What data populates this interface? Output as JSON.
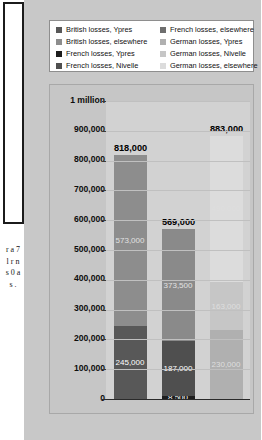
{
  "page_edge": {
    "side_text": "r a 7 l r n s 0 a s ."
  },
  "legend": {
    "left_column": [
      {
        "label": "British losses, Ypres",
        "color": "#585858"
      },
      {
        "label": "British losses, elsewhere",
        "color": "#8d8d8d"
      },
      {
        "label": "French losses, Ypres",
        "color": "#1d1d1d"
      },
      {
        "label": "French losses, Nivelle",
        "color": "#4f4f4f"
      }
    ],
    "right_column": [
      {
        "label": "French losses, elsewhere",
        "color": "#6e6e6e"
      },
      {
        "label": "German losses, Ypres",
        "color": "#b0b0b0"
      },
      {
        "label": "German losses, Nivelle",
        "color": "#c6c6c6"
      },
      {
        "label": "German losses, elsewhere",
        "color": "#dcdcdc"
      }
    ]
  },
  "chart_data": {
    "type": "bar",
    "subtype": "stacked",
    "title": "",
    "xlabel": "",
    "ylabel": "",
    "ylim": [
      0,
      1000000
    ],
    "grid": true,
    "legend_position": "top",
    "categories": [
      "British losses",
      "French losses",
      "German losses"
    ],
    "y_ticks": [
      {
        "value": 1000000,
        "label": "1 million"
      },
      {
        "value": 900000,
        "label": "900,000"
      },
      {
        "value": 800000,
        "label": "800,000"
      },
      {
        "value": 700000,
        "label": "700,000"
      },
      {
        "value": 600000,
        "label": "600,000"
      },
      {
        "value": 500000,
        "label": "500,000"
      },
      {
        "value": 400000,
        "label": "400,000"
      },
      {
        "value": 300000,
        "label": "300,000"
      },
      {
        "value": 200000,
        "label": "200,000"
      },
      {
        "value": 100000,
        "label": "100,000"
      },
      {
        "value": 0,
        "label": "0"
      }
    ],
    "bars": [
      {
        "name": "British losses",
        "total": 818000,
        "total_label": "818,000",
        "segments": [
          {
            "name": "British losses, Ypres",
            "value": 245000,
            "label": "245,000",
            "color": "#585858"
          },
          {
            "name": "British losses, elsewhere",
            "value": 573000,
            "label": "573,000",
            "color": "#8d8d8d"
          }
        ]
      },
      {
        "name": "French losses",
        "total": 569000,
        "total_label": "569,000",
        "segments": [
          {
            "name": "French losses, Ypres",
            "value": 8500,
            "label": "8,500",
            "color": "#1d1d1d"
          },
          {
            "name": "French losses, Nivelle",
            "value": 187000,
            "label": "187,000",
            "color": "#4f4f4f"
          },
          {
            "name": "French losses, elsewhere",
            "value": 373500,
            "label": "373,500",
            "color": "#8a8a8a"
          }
        ]
      },
      {
        "name": "German losses",
        "total": 883000,
        "total_label": "883,000",
        "segments": [
          {
            "name": "German losses, Ypres",
            "value": 230000,
            "label": "230,000",
            "color": "#b0b0b0"
          },
          {
            "name": "German losses, Nivelle",
            "value": 163000,
            "label": "163,000",
            "color": "#c6c6c6"
          },
          {
            "name": "German losses, elsewhere",
            "value": 490000,
            "label": "490,000",
            "color": "#dcdcdc"
          }
        ]
      }
    ]
  }
}
